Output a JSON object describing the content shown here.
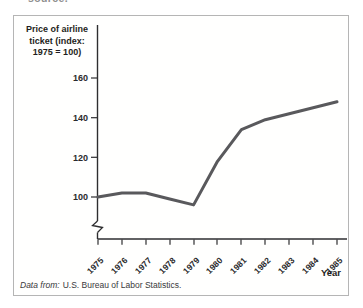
{
  "page": {
    "cropped_top_text": "source."
  },
  "panel": {
    "border_color": "#b5b5b5",
    "background": "#ffffff"
  },
  "chart_data": {
    "type": "line",
    "title": "Price of airline ticket (index: 1975 = 100)",
    "title_lines": [
      "Price of airline",
      "ticket (index:",
      "1975 = 100)"
    ],
    "xlabel": "Year",
    "x": [
      "1975",
      "1976",
      "1977",
      "1978",
      "1979",
      "1980",
      "1981",
      "1982",
      "1983",
      "1984",
      "1985"
    ],
    "values": [
      100,
      102,
      102,
      99,
      96,
      118,
      134,
      139,
      142,
      145,
      148
    ],
    "yticks": [
      "100",
      "120",
      "140",
      "160"
    ],
    "ylim": [
      93,
      168
    ],
    "y_axis_break": true,
    "grid": false,
    "legend": "none",
    "line_color": "#59595c",
    "axis_color": "#2e2e30"
  },
  "footer": {
    "prefix": "Data from:",
    "text": "U.S. Bureau of Labor Statistics."
  }
}
